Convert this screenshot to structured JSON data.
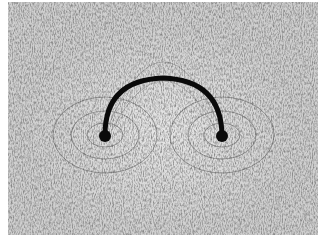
{
  "image": {
    "subject": "iron filings showing magnetic field lines around a semicircular conductor",
    "background_color": "#d6d6d6",
    "filing_color": "#2a2a2a",
    "conductor_color": "#0a0a0a"
  }
}
